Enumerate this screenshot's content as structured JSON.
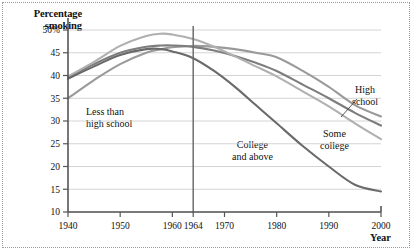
{
  "figure": {
    "y_axis_title_line1": "Percentage",
    "y_axis_title_line2": "smoking",
    "x_axis_title": "Year"
  },
  "labels": {
    "less_than_high_school_line1": "Less than",
    "less_than_high_school_line2": "high school",
    "college_line1": "College",
    "college_line2": "and above",
    "some_college_line1": "Some",
    "some_college_line2": "college",
    "high_school_line1": "High",
    "high_school_line2": "school"
  },
  "colors": {
    "grid": "#c9c9c9",
    "axis": "#555555",
    "event_line": "#6e6e6e",
    "less_than_high_school": "#9a9a9a",
    "high_school": "#7d7d7d",
    "some_college": "#b0b0b0",
    "college_and_above": "#6a6a6a",
    "text": "#111111"
  },
  "chart_data": {
    "type": "line",
    "title": "",
    "xlabel": "Year",
    "ylabel": "Percentage smoking",
    "xlim": [
      1940,
      2000
    ],
    "ylim": [
      10,
      50
    ],
    "grid": true,
    "legend": "inline-annotations",
    "xticks": [
      1940,
      1950,
      1960,
      1964,
      1970,
      1980,
      1990,
      2000
    ],
    "xtick_labels": [
      "1940",
      "1950",
      "1960",
      "1964",
      "1970",
      "1980",
      "1990",
      "2000"
    ],
    "yticks": [
      10,
      15,
      20,
      25,
      30,
      35,
      40,
      45,
      50
    ],
    "ytick_labels": [
      "10",
      "15",
      "20",
      "25",
      "30",
      "35",
      "40",
      "45",
      "50%"
    ],
    "annotations": [
      {
        "text": "Less than high school",
        "x": 1947,
        "y": 33
      },
      {
        "text": "College and above",
        "x": 1977,
        "y": 26
      },
      {
        "text": "Some college",
        "x": 1989,
        "y": 30
      },
      {
        "text": "High school",
        "x": 1995,
        "y": 37
      }
    ],
    "event_lines": [
      {
        "x": 1964,
        "label": "1964"
      }
    ],
    "x": [
      1940,
      1945,
      1950,
      1955,
      1958,
      1960,
      1964,
      1968,
      1972,
      1976,
      1980,
      1985,
      1990,
      1995,
      2000
    ],
    "series": [
      {
        "name": "Less than high school",
        "values": [
          35.0,
          39.0,
          42.5,
          45.0,
          45.8,
          46.2,
          46.5,
          46.3,
          45.8,
          45.0,
          44.0,
          41.0,
          37.5,
          33.5,
          31.0
        ]
      },
      {
        "name": "High school",
        "values": [
          39.5,
          42.5,
          45.0,
          46.3,
          46.6,
          46.6,
          46.3,
          45.5,
          44.3,
          42.8,
          41.0,
          38.0,
          35.0,
          31.8,
          29.0
        ]
      },
      {
        "name": "Some college",
        "values": [
          39.8,
          43.0,
          46.5,
          48.7,
          49.2,
          49.0,
          48.0,
          46.3,
          44.2,
          42.0,
          39.8,
          36.5,
          33.2,
          29.5,
          26.0
        ]
      },
      {
        "name": "College and above",
        "values": [
          39.3,
          42.0,
          44.5,
          45.8,
          45.8,
          45.3,
          43.8,
          41.0,
          37.5,
          33.5,
          29.5,
          24.5,
          20.0,
          16.0,
          14.5
        ]
      }
    ]
  }
}
